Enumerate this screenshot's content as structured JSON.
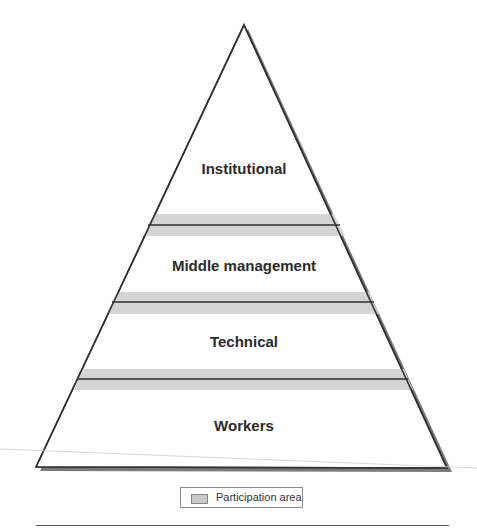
{
  "diagram": {
    "type": "pyramid",
    "levels": [
      {
        "label": "Institutional",
        "position": "top"
      },
      {
        "label": "Middle management",
        "position": "upper-middle"
      },
      {
        "label": "Technical",
        "position": "lower-middle"
      },
      {
        "label": "Workers",
        "position": "bottom"
      }
    ],
    "participation_bands": 3,
    "colors": {
      "outline": "#333333",
      "shadow": "#7a7a7a",
      "participation_band": "#d4d4d4",
      "band_line": "#2f2f2f"
    }
  },
  "legend": {
    "label": "Participation area"
  }
}
